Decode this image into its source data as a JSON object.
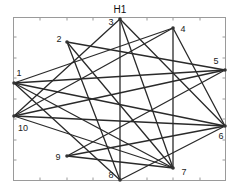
{
  "title": "H1",
  "nodes": [
    {
      "id": "1",
      "label": "1"
    },
    {
      "id": "2",
      "label": "2"
    },
    {
      "id": "3",
      "label": "3"
    },
    {
      "id": "4",
      "label": "4"
    },
    {
      "id": "5",
      "label": "5"
    },
    {
      "id": "6",
      "label": "6"
    },
    {
      "id": "7",
      "label": "7"
    },
    {
      "id": "8",
      "label": "8"
    },
    {
      "id": "9",
      "label": "9"
    },
    {
      "id": "10",
      "label": "10"
    }
  ],
  "edges": [
    [
      "1",
      "4"
    ],
    [
      "1",
      "5"
    ],
    [
      "1",
      "6"
    ],
    [
      "1",
      "7"
    ],
    [
      "1",
      "8"
    ],
    [
      "2",
      "5"
    ],
    [
      "2",
      "7"
    ],
    [
      "2",
      "8"
    ],
    [
      "3",
      "10"
    ],
    [
      "3",
      "8"
    ],
    [
      "3",
      "7"
    ],
    [
      "3",
      "6"
    ],
    [
      "4",
      "10"
    ],
    [
      "4",
      "7"
    ],
    [
      "4",
      "6"
    ],
    [
      "5",
      "9"
    ],
    [
      "5",
      "10"
    ],
    [
      "6",
      "10"
    ],
    [
      "6",
      "9"
    ],
    [
      "6",
      "8"
    ],
    [
      "7",
      "9"
    ],
    [
      "7",
      "10"
    ]
  ]
}
